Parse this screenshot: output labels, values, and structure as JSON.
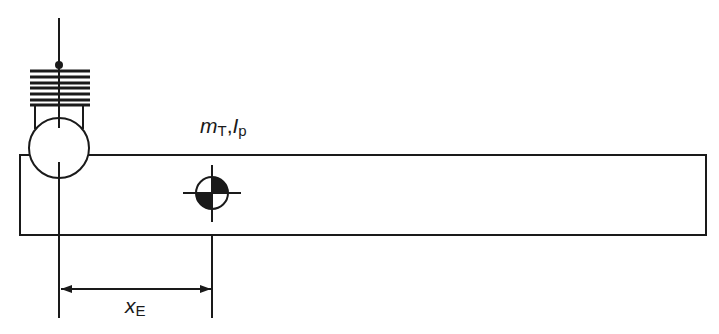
{
  "diagram": {
    "type": "mechanical-schematic",
    "labels": {
      "mass_inertia": {
        "m": "m",
        "m_sub": "T",
        "sep": ",",
        "i": "I",
        "i_sub": "p"
      },
      "distance": {
        "x": "x",
        "x_sub": "E"
      }
    },
    "elements": [
      {
        "name": "beam",
        "shape": "rectangle"
      },
      {
        "name": "pivot-circle",
        "shape": "circle"
      },
      {
        "name": "spring-stack",
        "lines": 7
      },
      {
        "name": "center-of-gravity-symbol",
        "shape": "quartered-circle"
      },
      {
        "name": "dimension-arrow",
        "shape": "double-arrow"
      }
    ],
    "stroke_color": "#1a1a1a",
    "background": "#ffffff"
  }
}
